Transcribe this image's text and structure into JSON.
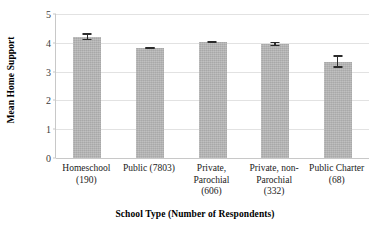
{
  "chart_data": {
    "type": "bar",
    "title": "",
    "xlabel": "School Type (Number of Respondents)",
    "ylabel": "Mean Home Support",
    "ylim": [
      0,
      5
    ],
    "yticks": [
      "0",
      "1",
      "2",
      "3",
      "4",
      "5"
    ],
    "grid": true,
    "legend": "none",
    "bar_color": "#b4b4b4",
    "error_bar_color": "#2b2b2b",
    "gridline_color": "#e2e2e2",
    "axis_color": "#c8c8c8",
    "categories": [
      "Homeschool (190)",
      "Public (7803)",
      "Private, Parochial (606)",
      "Private, non-Parochial (332)",
      "Public Charter (68)"
    ],
    "tick_label_lines": [
      [
        "Homeschool",
        "(190)"
      ],
      [
        "Public (7803)"
      ],
      [
        "Private,",
        "Parochial",
        "(606)"
      ],
      [
        "Private, non-",
        "Parochial",
        "(332)"
      ],
      [
        "Public Charter",
        "(68)"
      ]
    ],
    "respondents": [
      190,
      7803,
      606,
      332,
      68
    ],
    "values": [
      4.2,
      3.82,
      4.02,
      3.96,
      3.35
    ],
    "error_low": [
      4.09,
      3.79,
      3.98,
      3.89,
      3.14
    ],
    "error_high": [
      4.33,
      3.85,
      4.07,
      4.04,
      3.57
    ]
  }
}
